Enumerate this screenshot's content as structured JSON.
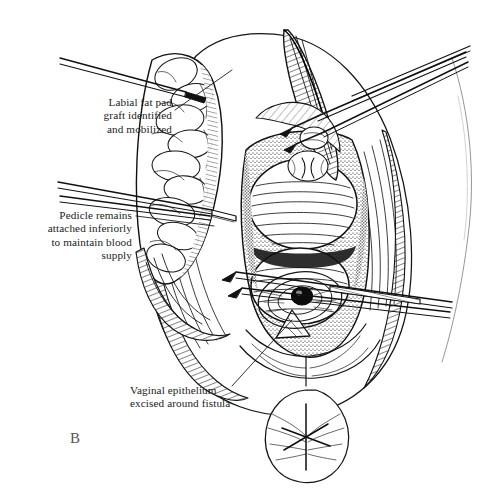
{
  "figure": {
    "panel_letter": "B",
    "medium": "pen-and-ink line drawing",
    "ink_color": "#111111",
    "background_color": "#ffffff"
  },
  "callouts": [
    {
      "id": "labial-fat-pad",
      "text": "Labial fat pad\ngraft identified\nand mobilized",
      "align": "right",
      "leader_from": [
        175,
        110
      ],
      "leader_to": [
        232,
        70
      ]
    },
    {
      "id": "pedicle",
      "text": "Pedicle remains\nattached inferiorly\nto maintain blood\nsupply",
      "align": "right",
      "leader_from": [
        136,
        216
      ],
      "leader_to": [
        214,
        226
      ]
    },
    {
      "id": "vaginal-epithelium",
      "text": "Vaginal epithelium\nexcised around fistula",
      "align": "left",
      "leader_from": [
        232,
        386
      ],
      "leader_to": [
        292,
        320
      ]
    }
  ],
  "anatomy": [
    {
      "name": "labial-fat-pad-graft",
      "note": "lobulated fatty mass held at upper left"
    },
    {
      "name": "vaginal-canal",
      "note": "central stippled cavity held open by retractor"
    },
    {
      "name": "anterior-vaginal-wall-mass",
      "note": "upper rounded hatched tissue bolus"
    },
    {
      "name": "posterior-vaginal-wall-mass",
      "note": "lower rounded hatched tissue bolus"
    },
    {
      "name": "fistula-opening",
      "note": "dark oval defect with concentric excision margin"
    },
    {
      "name": "perineal-body",
      "note": "lower ovoid structure with stellate marking"
    },
    {
      "name": "thigh-contour",
      "note": "faint curved outline at right margin"
    }
  ],
  "instruments": [
    {
      "name": "retractor-blade",
      "note": "broad hatched blade at top center"
    },
    {
      "name": "upper-forceps",
      "note": "thin paired shafts crossing to lower left"
    },
    {
      "name": "left-forceps",
      "note": "paired shafts converging off the left edge"
    },
    {
      "name": "lower-forceps",
      "note": "paired shafts crossing fistula toward right edge"
    }
  ]
}
